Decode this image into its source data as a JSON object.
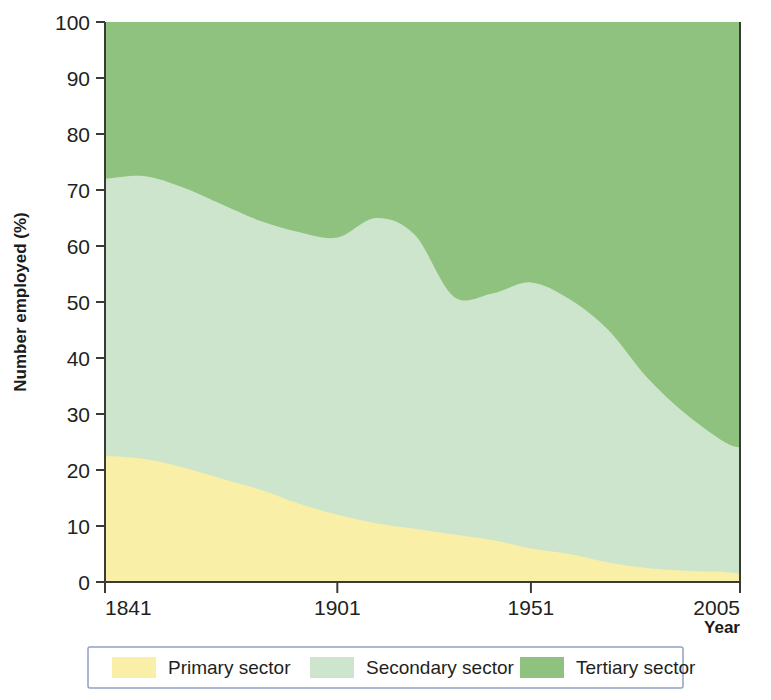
{
  "chart_data": {
    "type": "area",
    "stacked": true,
    "title": "",
    "xlabel": "Year",
    "ylabel": "Number employed (%)",
    "xlim": [
      1841,
      2005
    ],
    "ylim": [
      0,
      100
    ],
    "grid": false,
    "legend_position": "bottom",
    "x_tick_labels": [
      "1841",
      "1901",
      "1951",
      "2005"
    ],
    "x_ticks": [
      1841,
      1901,
      1951,
      2005
    ],
    "y_tick_labels": [
      "0",
      "10",
      "20",
      "30",
      "40",
      "50",
      "60",
      "70",
      "80",
      "90",
      "100"
    ],
    "y_ticks": [
      0,
      10,
      20,
      30,
      40,
      50,
      60,
      70,
      80,
      90,
      100
    ],
    "x": [
      1841,
      1851,
      1861,
      1871,
      1881,
      1891,
      1901,
      1911,
      1921,
      1931,
      1941,
      1951,
      1961,
      1971,
      1981,
      1991,
      2001,
      2005
    ],
    "series": [
      {
        "name": "Primary sector",
        "color": "#F9EFA6",
        "values": [
          22.5,
          22.0,
          20.5,
          18.5,
          16.5,
          14.0,
          12.0,
          10.5,
          9.5,
          8.5,
          7.5,
          6.0,
          5.0,
          3.5,
          2.5,
          2.0,
          1.8,
          1.5
        ]
      },
      {
        "name": "Secondary sector",
        "color": "#CDE5CC",
        "values": [
          49.5,
          50.5,
          50.0,
          49.0,
          48.0,
          48.5,
          49.5,
          54.5,
          52.5,
          42.5,
          44.0,
          47.5,
          45.5,
          41.5,
          34.0,
          28.0,
          23.2,
          22.5
        ]
      },
      {
        "name": "Tertiary sector",
        "color": "#8EC27E",
        "values": [
          28.0,
          27.5,
          29.5,
          32.5,
          35.5,
          37.5,
          38.5,
          35.0,
          38.0,
          49.0,
          48.5,
          46.5,
          49.5,
          55.0,
          63.5,
          70.0,
          75.0,
          76.0
        ]
      }
    ],
    "boundaries": {
      "primary_top": [
        22.5,
        22.0,
        20.5,
        18.5,
        16.5,
        14.0,
        12.0,
        10.5,
        9.5,
        8.5,
        7.5,
        6.0,
        5.0,
        3.5,
        2.5,
        2.0,
        1.8,
        1.5
      ],
      "secondary_top": [
        72.0,
        72.5,
        70.5,
        67.5,
        64.5,
        62.5,
        61.5,
        65.0,
        62.0,
        51.0,
        51.5,
        53.5,
        50.5,
        45.0,
        36.5,
        30.0,
        25.0,
        24.0
      ]
    }
  },
  "axes": {
    "y_axis_title": "Number employed (%)",
    "x_axis_title": "Year"
  },
  "legend": {
    "items": [
      {
        "label": "Primary sector",
        "color": "#F9EFA6"
      },
      {
        "label": "Secondary sector",
        "color": "#CDE5CC"
      },
      {
        "label": "Tertiary sector",
        "color": "#8EC27E"
      }
    ]
  }
}
